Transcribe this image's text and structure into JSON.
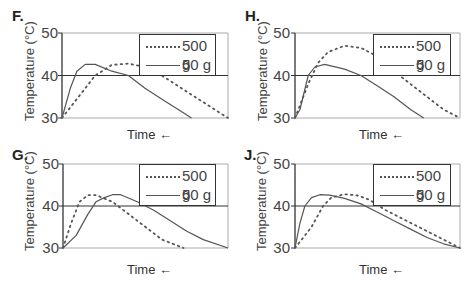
{
  "chart_data": [
    {
      "type": "line",
      "panel": "F.",
      "xlabel": "Time ←",
      "ylabel": "Temperature (°C)",
      "yticks": [
        "50",
        "40",
        "30"
      ],
      "ylim": [
        30,
        50
      ],
      "grid": "horizontal line at 40",
      "legend_position": "top-right inside",
      "series": [
        {
          "name": "500 g",
          "style": "dotted",
          "points": [
            [
              0,
              30
            ],
            [
              10,
              35
            ],
            [
              20,
              40
            ],
            [
              30,
              42.5
            ],
            [
              40,
              42.8
            ],
            [
              50,
              42
            ],
            [
              60,
              40
            ],
            [
              70,
              37.5
            ],
            [
              80,
              35
            ],
            [
              90,
              32.5
            ],
            [
              100,
              30
            ]
          ]
        },
        {
          "name": "50 g",
          "style": "solid",
          "points": [
            [
              0,
              30
            ],
            [
              5,
              37
            ],
            [
              9,
              41
            ],
            [
              14,
              42.6
            ],
            [
              20,
              42.6
            ],
            [
              30,
              41
            ],
            [
              40,
              40
            ],
            [
              50,
              37
            ],
            [
              60,
              34.5
            ],
            [
              70,
              32
            ],
            [
              78,
              30
            ]
          ]
        }
      ]
    },
    {
      "type": "line",
      "panel": "H.",
      "xlabel": "Time ←",
      "ylabel": "Temperature (°C)",
      "yticks": [
        "50",
        "40",
        "30"
      ],
      "ylim": [
        30,
        50
      ],
      "grid": "horizontal line at 40",
      "legend_position": "top-right inside",
      "series": [
        {
          "name": "500 g",
          "style": "dotted",
          "points": [
            [
              0,
              30
            ],
            [
              8,
              38
            ],
            [
              14,
              43
            ],
            [
              20,
              45.5
            ],
            [
              30,
              47
            ],
            [
              40,
              46.5
            ],
            [
              50,
              44.5
            ],
            [
              60,
              41
            ],
            [
              70,
              38
            ],
            [
              80,
              35
            ],
            [
              90,
              32
            ],
            [
              100,
              30
            ]
          ]
        },
        {
          "name": "50 g",
          "style": "solid",
          "points": [
            [
              0,
              30
            ],
            [
              3,
              32
            ],
            [
              8,
              40
            ],
            [
              12,
              42
            ],
            [
              18,
              42.6
            ],
            [
              30,
              41.5
            ],
            [
              40,
              40
            ],
            [
              50,
              37.5
            ],
            [
              60,
              35
            ],
            [
              70,
              32
            ],
            [
              78,
              30
            ]
          ]
        }
      ]
    },
    {
      "type": "line",
      "panel": "G.",
      "xlabel": "Time ←",
      "ylabel": "Temperature (°C)",
      "yticks": [
        "50",
        "40",
        "30"
      ],
      "ylim": [
        30,
        50
      ],
      "grid": "horizontal line at 40",
      "legend_position": "top-right inside",
      "series": [
        {
          "name": "500 g",
          "style": "dotted",
          "points": [
            [
              0,
              30
            ],
            [
              5,
              36
            ],
            [
              10,
              41
            ],
            [
              15,
              42.6
            ],
            [
              20,
              42.6
            ],
            [
              30,
              41
            ],
            [
              40,
              38
            ],
            [
              50,
              35
            ],
            [
              60,
              32
            ],
            [
              73,
              30
            ]
          ]
        },
        {
          "name": "50 g",
          "style": "solid",
          "points": [
            [
              0,
              30
            ],
            [
              8,
              33
            ],
            [
              15,
              38
            ],
            [
              20,
              41
            ],
            [
              25,
              42
            ],
            [
              30,
              42.7
            ],
            [
              35,
              42.7
            ],
            [
              45,
              41
            ],
            [
              55,
              39
            ],
            [
              65,
              36.5
            ],
            [
              75,
              34
            ],
            [
              85,
              32
            ],
            [
              100,
              30
            ]
          ]
        }
      ]
    },
    {
      "type": "line",
      "panel": "J.",
      "xlabel": "Time ←",
      "ylabel": "Temperature (°C)",
      "yticks": [
        "50",
        "40",
        "30"
      ],
      "ylim": [
        30,
        50
      ],
      "grid": "horizontal line at 40",
      "legend_position": "top-right inside",
      "series": [
        {
          "name": "500 g",
          "style": "dotted",
          "points": [
            [
              0,
              30
            ],
            [
              5,
              32.5
            ],
            [
              10,
              35
            ],
            [
              17,
              40
            ],
            [
              22,
              42
            ],
            [
              30,
              42.8
            ],
            [
              38,
              42.5
            ],
            [
              45,
              41.5
            ],
            [
              55,
              39
            ],
            [
              65,
              37
            ],
            [
              75,
              35
            ],
            [
              85,
              33
            ],
            [
              95,
              31
            ],
            [
              100,
              30
            ]
          ]
        },
        {
          "name": "50 g",
          "style": "solid",
          "points": [
            [
              0,
              30
            ],
            [
              3,
              36
            ],
            [
              6,
              40
            ],
            [
              10,
              42
            ],
            [
              15,
              42.7
            ],
            [
              21,
              42.6
            ],
            [
              30,
              41.8
            ],
            [
              40,
              40.5
            ],
            [
              50,
              38.5
            ],
            [
              60,
              36.5
            ],
            [
              70,
              34.5
            ],
            [
              80,
              32.5
            ],
            [
              90,
              31
            ],
            [
              100,
              30
            ]
          ]
        }
      ]
    }
  ],
  "panels": [
    {
      "letter": "F.",
      "xlabel": "Time ←",
      "ylabel": "Temperature (°C)",
      "yticks": [
        "50",
        "40",
        "30"
      ],
      "legend": [
        "500 g",
        "50 g"
      ]
    },
    {
      "letter": "H.",
      "xlabel": "Time ←",
      "ylabel": "Temperature (°C)",
      "yticks": [
        "50",
        "40",
        "30"
      ],
      "legend": [
        "500 g",
        "50 g"
      ]
    },
    {
      "letter": "G.",
      "xlabel": "Time ←",
      "ylabel": "Temperature (°C)",
      "yticks": [
        "50",
        "40",
        "30"
      ],
      "legend": [
        "500 g",
        "50 g"
      ]
    },
    {
      "letter": "J.",
      "xlabel": "Time ←",
      "ylabel": "Temperature (°C)",
      "yticks": [
        "50",
        "40",
        "30"
      ],
      "legend": [
        "500 g",
        "50 g"
      ]
    }
  ],
  "colors": {
    "line": "#555555",
    "axis": "#333333",
    "frame": "#aaaaaa"
  }
}
